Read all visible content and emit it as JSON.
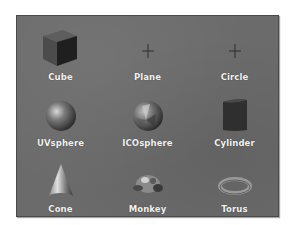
{
  "panel": {
    "title": "Mesh primitives",
    "items": [
      {
        "label": "Cube",
        "icon": "cube-icon"
      },
      {
        "label": "Plane",
        "icon": "plane-icon"
      },
      {
        "label": "Circle",
        "icon": "circle-icon"
      },
      {
        "label": "UVsphere",
        "icon": "uvsphere-icon"
      },
      {
        "label": "ICOsphere",
        "icon": "icosphere-icon"
      },
      {
        "label": "Cylinder",
        "icon": "cylinder-icon"
      },
      {
        "label": "Cone",
        "icon": "cone-icon"
      },
      {
        "label": "Monkey",
        "icon": "monkey-icon"
      },
      {
        "label": "Torus",
        "icon": "torus-icon"
      }
    ]
  },
  "colors": {
    "panel_bg": "#6b6b6b",
    "label_text": "#f2f2f2",
    "page_bg": "#ffffff"
  }
}
